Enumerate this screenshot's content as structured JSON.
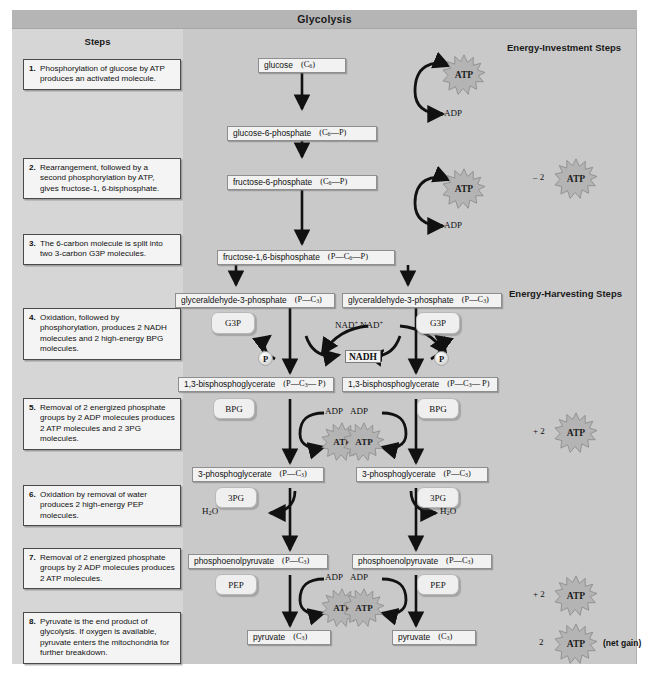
{
  "figure": {
    "title": "Glycolysis",
    "steps_heading": "Steps",
    "investment_heading": "Energy-Investment Steps",
    "harvesting_heading": "Energy-Harvesting Steps"
  },
  "steps": [
    {
      "num": "1.",
      "text": "Phosphorylation of glucose by ATP produces an activated molecule."
    },
    {
      "num": "2.",
      "text": "Rearrangement, followed by a second phosphorylation by ATP,  gives fructose-1, 6-bisphosphate."
    },
    {
      "num": "3.",
      "text": "The 6-carbon molecule is split into two 3-carbon G3P molecules."
    },
    {
      "num": "4.",
      "text": "Oxidation, followed by phosphorylation, produces 2 NADH molecules and 2 high-energy BPG molecules."
    },
    {
      "num": "5.",
      "text": "Removal of 2 energized phosphate groups by 2 ADP molecules produces 2 ATP molecules and 2 3PG molecules."
    },
    {
      "num": "6.",
      "text": "Oxidation by removal of water produces 2 high-energy PEP molecules."
    },
    {
      "num": "7.",
      "text": "Removal of 2 energized phosphate groups by 2 ADP molecules produces 2 ATP molecules."
    },
    {
      "num": "8.",
      "text": "Pyruvate is the end product of glycolysis. If oxygen is available, pyruvate enters the mitochondria for further breakdown."
    }
  ],
  "molecules": {
    "glucose": {
      "name": "glucose",
      "formula": "(C6)"
    },
    "g6p": {
      "name": "glucose-6-phosphate",
      "formula": "(C6—P)"
    },
    "f6p": {
      "name": "fructose-6-phosphate",
      "formula": "(C6—P)"
    },
    "fbp": {
      "name": "fructose-1,6-bisphosphate",
      "formula": "(P—C6—P)"
    },
    "g3p": {
      "name": "glyceraldehyde-3-phosphate",
      "formula": "(P—C3)"
    },
    "bpg": {
      "name": "1,3-bisphosphoglycerate",
      "formula": "(P—C3— P)"
    },
    "pg3": {
      "name": "3-phosphoglycerate",
      "formula": "(P—C3)"
    },
    "pep": {
      "name": "phosphoenolpyruvate",
      "formula": "(P—C3)"
    },
    "pyruvate": {
      "name": "pyruvate",
      "formula": "(C3)"
    }
  },
  "pills": {
    "g3p": "G3P",
    "bpg": "BPG",
    "pg3": "3PG",
    "pep": "PEP"
  },
  "labels": {
    "atp": "ATP",
    "adp": "ADP",
    "nad_plus": "NAD+",
    "nadh": "NADH",
    "nadh_left": "NADH",
    "nadh_right": "2 NADH",
    "phosphate": "P",
    "water": "H2O",
    "invest_total": "– 2",
    "harvest_total_1": "+ 2",
    "harvest_total_2": "+ 2",
    "net_count": "2",
    "net_gain": "(net gain)"
  },
  "colors": {
    "figure_background": "#c9c9c9",
    "steps_background": "#d6d6d6",
    "title_bar": "#b5b5b5",
    "box_fill": "#f2f2f2",
    "arrow": "#111111",
    "atp_burst": "#b4b4b4"
  }
}
